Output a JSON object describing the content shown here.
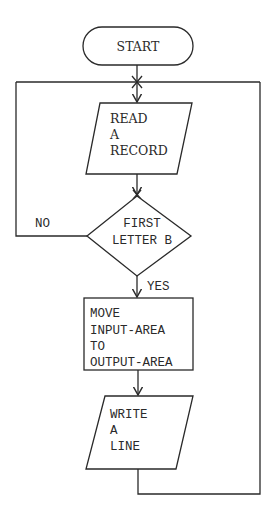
{
  "diagram": {
    "type": "flowchart",
    "nodes": {
      "start": {
        "shape": "terminal",
        "label": "START"
      },
      "read": {
        "shape": "input-output",
        "lines": [
          "READ",
          "A",
          "RECORD"
        ]
      },
      "decision": {
        "shape": "decision",
        "lines": [
          "FIRST",
          "LETTER B"
        ]
      },
      "move": {
        "shape": "process",
        "lines": [
          "MOVE",
          "INPUT-AREA",
          "TO",
          "OUTPUT-AREA"
        ]
      },
      "write": {
        "shape": "input-output",
        "lines": [
          "WRITE",
          "A",
          "LINE"
        ]
      }
    },
    "edges": {
      "no_label": "NO",
      "yes_label": "YES"
    },
    "colors": {
      "line": "#2a2a2a",
      "background": "#ffffff"
    }
  }
}
